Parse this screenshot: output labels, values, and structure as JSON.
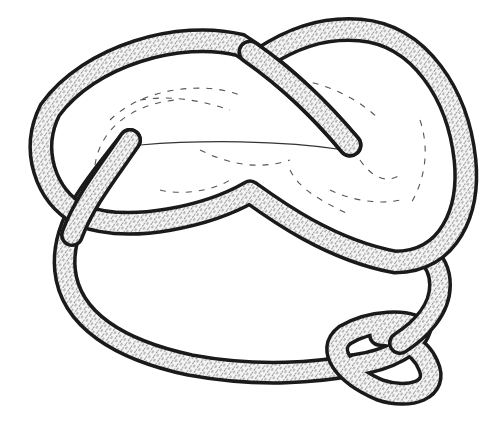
{
  "figure": {
    "colors": {
      "background": "#ffffff",
      "outline": "#1a1a1a",
      "tube_fill": "#f2f2f2",
      "hatch": "#3a3a3a",
      "surface_dash": "#555555"
    },
    "elements": [
      {
        "name": "surface-disk",
        "description": "dashed shaded surface bounded by main loop"
      },
      {
        "name": "main-loop-tube",
        "description": "figure-eight shaped outer tube"
      },
      {
        "name": "inner-strand-tube",
        "description": "strand passing through surface, ending in two caps"
      },
      {
        "name": "small-loop",
        "description": "small twisted loop at bottom right"
      }
    ]
  }
}
